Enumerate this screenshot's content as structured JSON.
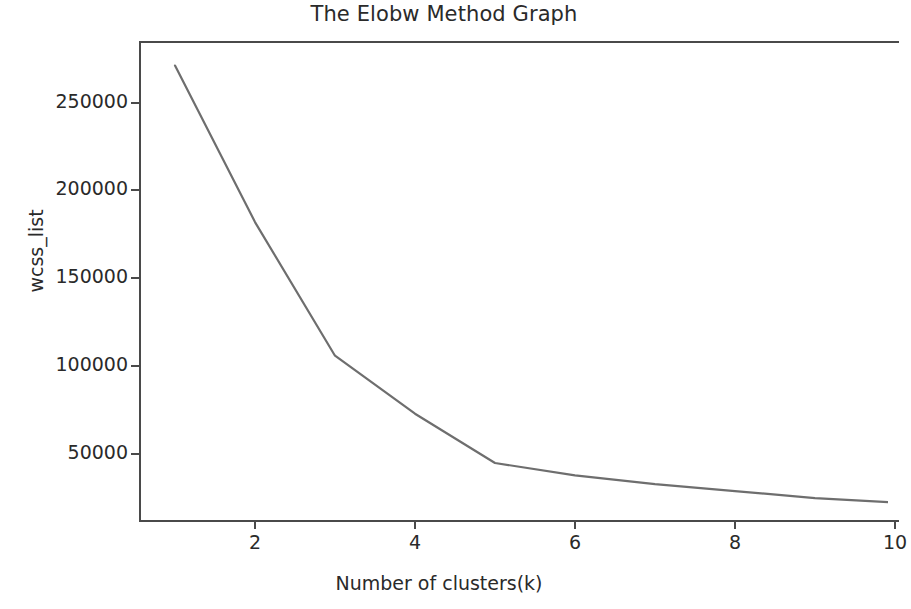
{
  "chart_data": {
    "type": "line",
    "title": "The Elobw Method Graph",
    "xlabel": "Number of clusters(k)",
    "ylabel": "wcss_list",
    "x": [
      1,
      2,
      3,
      4,
      5,
      6,
      7,
      8,
      9,
      10
    ],
    "values": [
      271000,
      182000,
      106000,
      73000,
      45000,
      38000,
      33000,
      29000,
      25000,
      22500
    ],
    "series": [
      {
        "name": "wcss_list",
        "values": [
          271000,
          182000,
          106000,
          73000,
          45000,
          38000,
          33000,
          29000,
          25000,
          22500
        ],
        "color": "#6e6e6e"
      }
    ],
    "xticks": [
      2,
      4,
      6,
      8,
      10
    ],
    "xtick_labels": [
      "2",
      "4",
      "6",
      "8",
      "10"
    ],
    "yticks": [
      50000,
      100000,
      150000,
      200000,
      250000
    ],
    "ytick_labels": [
      "50000",
      "100000",
      "150000",
      "200000",
      "250000"
    ],
    "xlim": [
      0.55,
      10.05
    ],
    "ylim": [
      12000,
      285000
    ],
    "grid": false,
    "legend": false,
    "legend_position": "none",
    "line_color": "#6e6e6e",
    "axis_color": "#4a4a4a",
    "background_color": "#ffffff",
    "marker": "none"
  }
}
